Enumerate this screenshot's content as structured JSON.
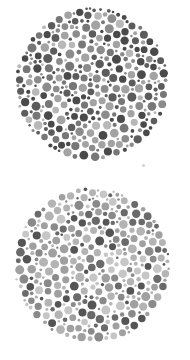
{
  "canvas": {
    "width": 190,
    "height": 360,
    "background": "#ffffff"
  },
  "plates": [
    {
      "name": "plate-top",
      "cx": 92,
      "cy": 84,
      "r": 77,
      "seed": 1337,
      "dot_radius_min": 1.2,
      "dot_radius_max": 4.6,
      "dot_spacing": 0.9,
      "palette": [
        {
          "color": "#4a4a4a",
          "weight": 0.22
        },
        {
          "color": "#5c5c5c",
          "weight": 0.2
        },
        {
          "color": "#777777",
          "weight": 0.18
        },
        {
          "color": "#8c8c8c",
          "weight": 0.18
        },
        {
          "color": "#a3a3a3",
          "weight": 0.14
        },
        {
          "color": "#b8b8b8",
          "weight": 0.08
        }
      ]
    },
    {
      "name": "plate-bottom",
      "cx": 92,
      "cy": 265,
      "r": 78,
      "seed": 4242,
      "dot_radius_min": 1.2,
      "dot_radius_max": 4.6,
      "dot_spacing": 0.9,
      "palette": [
        {
          "color": "#555555",
          "weight": 0.1
        },
        {
          "color": "#6a6a6a",
          "weight": 0.1
        },
        {
          "color": "#8a8a8a",
          "weight": 0.18
        },
        {
          "color": "#a0a0a0",
          "weight": 0.24
        },
        {
          "color": "#b4b4b4",
          "weight": 0.24
        },
        {
          "color": "#c6c6c6",
          "weight": 0.14
        }
      ]
    }
  ],
  "speck": {
    "x": 143,
    "y": 165,
    "r": 1.5,
    "color": "#d0d0d0"
  }
}
